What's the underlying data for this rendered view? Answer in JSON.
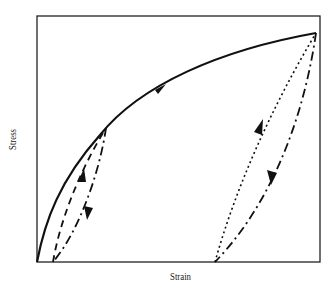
{
  "diagram": {
    "type": "stress-strain hysteresis",
    "xlabel": "Strain",
    "ylabel": "Stress",
    "colors": {
      "line": "#111111",
      "frame": "#222222",
      "background": "#ffffff"
    },
    "curves": [
      {
        "name": "primary-loading",
        "style": "solid",
        "direction": "up-right"
      },
      {
        "name": "small-unload",
        "style": "dashed",
        "direction": "down"
      },
      {
        "name": "small-reload",
        "style": "dashed",
        "direction": "up"
      },
      {
        "name": "large-reload",
        "style": "dotted",
        "direction": "up"
      },
      {
        "name": "large-unload",
        "style": "dash-dot",
        "direction": "down"
      }
    ]
  }
}
